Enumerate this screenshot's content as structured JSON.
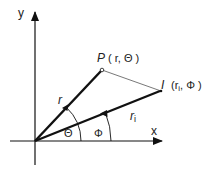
{
  "diagram": {
    "axes": {
      "x_label": "x",
      "y_label": "y"
    },
    "points": {
      "P": {
        "name": "P",
        "coords": "( r, Θ )"
      },
      "I": {
        "name": "I",
        "coords": "(r",
        "sub": "i",
        "coords_tail": ", Φ )"
      }
    },
    "segments": {
      "r_label": "r",
      "ri_label": "r",
      "ri_sub": "i"
    },
    "angles": {
      "theta": "Θ",
      "phi": "Φ"
    },
    "colors": {
      "stroke": "#111111",
      "thin_stroke": "#555555",
      "background": "#ffffff"
    }
  }
}
